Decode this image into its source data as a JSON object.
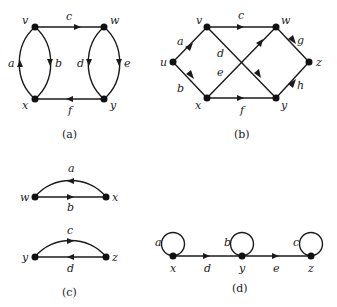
{
  "figures": {
    "a": {
      "caption": "(a)",
      "vertices": {
        "v": "v",
        "w": "w",
        "x": "x",
        "y": "y"
      },
      "edges": {
        "a": "a",
        "b": "b",
        "c": "c",
        "d": "d",
        "e": "e",
        "f": "f"
      }
    },
    "b": {
      "caption": "(b)",
      "vertices": {
        "u": "u",
        "v": "v",
        "w": "w",
        "x": "x",
        "y": "y",
        "z": "z"
      },
      "edges": {
        "a": "a",
        "b": "b",
        "c": "c",
        "d": "d",
        "e": "e",
        "f": "f",
        "g": "g",
        "h": "h"
      }
    },
    "c": {
      "caption": "(c)",
      "vertices": {
        "w": "w",
        "x": "x",
        "y": "y",
        "z": "z"
      },
      "edges": {
        "a": "a",
        "b": "b",
        "c": "c",
        "d": "d"
      }
    },
    "d": {
      "caption": "(d)",
      "vertices": {
        "x": "x",
        "y": "y",
        "z": "z"
      },
      "edges": {
        "a": "a",
        "b": "b",
        "c": "c",
        "d": "d",
        "e": "e"
      }
    }
  },
  "colors": {
    "ink": "#1a1a1a",
    "background": "#ffffff"
  }
}
